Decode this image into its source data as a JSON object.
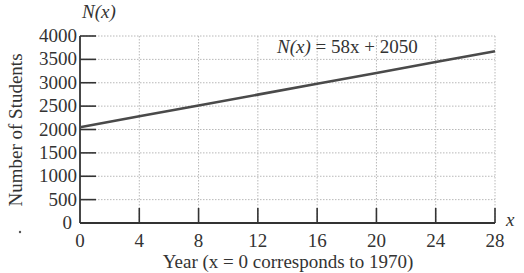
{
  "chart_data": {
    "type": "line",
    "title": "",
    "function_label": "N(x) = 58x + 2050",
    "y_axis_symbol": "N(x)",
    "x_axis_symbol": "x",
    "xlabel": "Year (x = 0 corresponds to 1970)",
    "ylabel": "Number of Students",
    "xlim": [
      0,
      28
    ],
    "ylim": [
      0,
      4000
    ],
    "x_ticks": [
      0,
      4,
      8,
      12,
      16,
      20,
      24,
      28
    ],
    "y_ticks": [
      0,
      500,
      1000,
      1500,
      2000,
      2500,
      3000,
      3500,
      4000
    ],
    "grid": true,
    "legend": "none",
    "series": [
      {
        "name": "N(x) = 58x + 2050",
        "slope": 58,
        "intercept": 2050,
        "x": [
          0,
          4,
          8,
          12,
          16,
          20,
          24,
          28
        ],
        "values": [
          2050,
          2282,
          2514,
          2746,
          2978,
          3210,
          3442,
          3674
        ],
        "color": "#4a4a4a"
      }
    ]
  },
  "labels": {
    "y_symbol": "N(x)",
    "x_symbol": "x",
    "equation_lhs": "N(x)",
    "equation_rhs": " = 58x + 2050",
    "ylabel": "Number of Students",
    "xlabel": "Year (x = 0 corresponds to 1970)",
    "origin_y_zero": "0",
    "origin_x_zero": "0"
  }
}
